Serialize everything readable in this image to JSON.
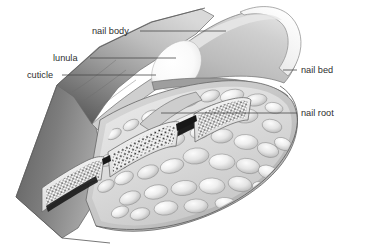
{
  "figure": {
    "background_color": "#ffffff",
    "label_color": "#2e2e2e",
    "leader_color": "#4a4a4a"
  },
  "labels": [
    {
      "id": "nail-body",
      "text": "nail body",
      "text_x": 92,
      "text_y": 34,
      "leader_x1": 140,
      "leader_y1": 31,
      "leader_x2": 226,
      "leader_y2": 31,
      "anchor": "start"
    },
    {
      "id": "lunula",
      "text": "lunula",
      "text_x": 53,
      "text_y": 61,
      "leader_x1": 90,
      "leader_y1": 58,
      "leader_x2": 176,
      "leader_y2": 58,
      "anchor": "start"
    },
    {
      "id": "cuticle",
      "text": "cuticle",
      "text_x": 27,
      "text_y": 78,
      "leader_x1": 62,
      "leader_y1": 75,
      "leader_x2": 156,
      "leader_y2": 75,
      "anchor": "start"
    },
    {
      "id": "nail-bed",
      "text": "nail bed",
      "text_x": 301,
      "text_y": 73,
      "leader_x1": 283,
      "leader_y1": 70,
      "leader_x2": 297,
      "leader_y2": 70,
      "anchor": "start"
    },
    {
      "id": "nail-root",
      "text": "nail root",
      "text_x": 301,
      "text_y": 116,
      "leader_x1": 161,
      "leader_y1": 113,
      "leader_x2": 297,
      "leader_y2": 113,
      "anchor": "start"
    }
  ],
  "structures": {
    "nail_plate_color": "#b9b9b9",
    "nail_tip_color": "#f2f2f2",
    "lunula_color": "#fafafa",
    "tissue_color": "#e3e3e3",
    "skin_shadow_color": "#585858",
    "bone_color": "#f4f4f4",
    "nail_root_color": "#1c1c1c"
  }
}
